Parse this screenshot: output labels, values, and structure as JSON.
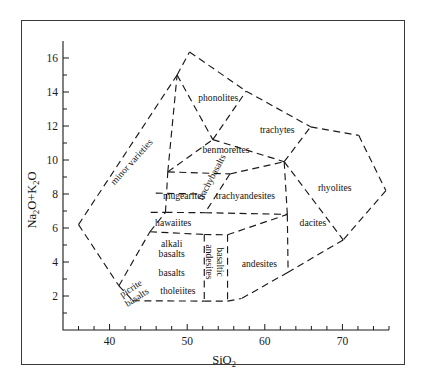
{
  "figure": {
    "kind": "tas-diagram",
    "title": "",
    "background_color": "#ffffff",
    "frame_color": "#3a3a3a",
    "line_color": "#1a1a1a"
  },
  "axes": {
    "x": {
      "label_main": "SiO",
      "label_sub": "2",
      "label_full": "SiO2",
      "min": 34,
      "max": 76,
      "tick_labels": [
        "40",
        "50",
        "60",
        "70"
      ],
      "tick_values": [
        40,
        50,
        60,
        70
      ],
      "minor_step": 2
    },
    "y": {
      "label_parts": [
        "Na",
        "2",
        "O+K",
        "2",
        "O"
      ],
      "label_full": "Na2O+K2O",
      "min": 0,
      "max": 17,
      "tick_labels": [
        "2",
        "4",
        "6",
        "8",
        "10",
        "12",
        "14",
        "16"
      ],
      "tick_values": [
        2,
        4,
        6,
        8,
        10,
        12,
        14,
        16
      ],
      "minor_step": 1
    }
  },
  "chart_data": {
    "type": "scatter",
    "title": "",
    "xlabel": "SiO2",
    "ylabel": "Na2O+K2O",
    "xlim": [
      34,
      76
    ],
    "ylim": [
      0,
      17
    ],
    "grid": false,
    "legend_position": "none",
    "x_ticks": [
      40,
      50,
      60,
      70
    ],
    "y_ticks": [
      2,
      4,
      6,
      8,
      10,
      12,
      14,
      16
    ],
    "x_minor_step": 2,
    "y_minor_step": 1,
    "fields": [
      {
        "name": "minor varieties",
        "label_x": 42.8,
        "label_y": 9.9,
        "rotation": -48,
        "polygon": [
          [
            36.0,
            6.2
          ],
          [
            41.2,
            2.6
          ],
          [
            45.2,
            5.8
          ],
          [
            47.5,
            9.3
          ],
          [
            48.7,
            15.0
          ],
          [
            36.0,
            6.2
          ]
        ]
      },
      {
        "name": "phonolites",
        "label_x": 54.0,
        "label_y": 13.7,
        "rotation": 0,
        "polygon": [
          [
            48.7,
            15.0
          ],
          [
            50.2,
            16.3
          ],
          [
            57.5,
            14.0
          ],
          [
            53.3,
            11.2
          ],
          [
            48.7,
            15.0
          ]
        ]
      },
      {
        "name": "trachytes",
        "label_x": 61.6,
        "label_y": 11.8,
        "rotation": 0,
        "polygon": [
          [
            57.5,
            14.0
          ],
          [
            65.8,
            11.9
          ],
          [
            62.5,
            9.9
          ],
          [
            53.3,
            11.2
          ],
          [
            57.5,
            14.0
          ]
        ]
      },
      {
        "name": "benmoreites",
        "label_x": 55.0,
        "label_y": 10.6,
        "rotation": 0,
        "polygon": [
          [
            53.3,
            11.2
          ],
          [
            62.5,
            9.9
          ],
          [
            55.5,
            9.2
          ],
          [
            47.5,
            9.3
          ],
          [
            53.3,
            11.2
          ]
        ]
      },
      {
        "name": "trachybasalts",
        "label_x": 53.1,
        "label_y": 9.0,
        "rotation": -62,
        "polygon": [
          [
            47.5,
            9.3
          ],
          [
            55.5,
            9.2
          ],
          [
            52.3,
            6.9
          ],
          [
            47.2,
            6.9
          ]
        ]
      },
      {
        "name": "mugearites",
        "label_x": 49.6,
        "label_y": 7.9,
        "rotation": 0,
        "polygon": [
          [
            47.2,
            6.9
          ],
          [
            52.3,
            6.9
          ],
          [
            47.0,
            6.9
          ],
          [
            45.8,
            8.1
          ]
        ]
      },
      {
        "name": "trachyandesites",
        "label_x": 57.5,
        "label_y": 7.9,
        "rotation": 0,
        "polygon": [
          [
            55.5,
            9.2
          ],
          [
            62.5,
            9.9
          ],
          [
            62.9,
            6.8
          ],
          [
            52.3,
            6.9
          ],
          [
            55.5,
            9.2
          ]
        ]
      },
      {
        "name": "rhyolites",
        "label_x": 69.0,
        "label_y": 8.4,
        "rotation": 0,
        "polygon": [
          [
            65.8,
            11.9
          ],
          [
            72.0,
            11.5
          ],
          [
            75.5,
            8.2
          ],
          [
            70.0,
            5.3
          ],
          [
            62.5,
            9.9
          ]
        ]
      },
      {
        "name": "dacites",
        "label_x": 66.2,
        "label_y": 6.3,
        "rotation": 0,
        "polygon": [
          [
            62.9,
            6.8
          ],
          [
            70.0,
            5.3
          ],
          [
            63.0,
            3.4
          ],
          [
            62.9,
            6.8
          ]
        ]
      },
      {
        "name": "hawaiites",
        "label_x": 48.2,
        "label_y": 6.3,
        "rotation": 0,
        "polygon": [
          [
            45.2,
            5.8
          ],
          [
            52.3,
            6.9
          ],
          [
            52.2,
            5.6
          ],
          [
            45.2,
            5.8
          ]
        ]
      },
      {
        "name": "alkali basalts",
        "label_lines": [
          "alkali",
          "basalts"
        ],
        "label_x": 48.0,
        "label_y": 4.8,
        "rotation": 0,
        "polygon": [
          [
            45.2,
            5.8
          ],
          [
            52.2,
            5.6
          ],
          [
            52.2,
            1.7
          ],
          [
            43.0,
            1.7
          ]
        ]
      },
      {
        "name": "basalts",
        "label_x": 48.0,
        "label_y": 3.4,
        "rotation": 0,
        "polygon": []
      },
      {
        "name": "tholeiites",
        "label_x": 48.8,
        "label_y": 2.3,
        "rotation": 0,
        "polygon": []
      },
      {
        "name": "picrite basalts",
        "label_lines": [
          "picrite",
          "basalts"
        ],
        "label_x": 43.1,
        "label_y": 2.2,
        "rotation": -33,
        "polygon": [
          [
            41.2,
            2.6
          ],
          [
            45.2,
            5.8
          ],
          [
            43.0,
            1.7
          ],
          [
            41.2,
            2.6
          ]
        ]
      },
      {
        "name": "basaltic andesites",
        "label_lines": [
          "basaltic",
          "andesites"
        ],
        "label_x": 53.6,
        "label_y": 4.0,
        "rotation": 90,
        "polygon": [
          [
            52.2,
            5.6
          ],
          [
            55.2,
            5.6
          ],
          [
            55.2,
            1.7
          ],
          [
            52.2,
            1.7
          ]
        ]
      },
      {
        "name": "andesites",
        "label_x": 59.3,
        "label_y": 3.9,
        "rotation": 0,
        "polygon": [
          [
            55.2,
            5.6
          ],
          [
            62.9,
            6.8
          ],
          [
            63.0,
            3.4
          ],
          [
            57.0,
            1.8
          ],
          [
            55.2,
            1.7
          ]
        ]
      }
    ]
  },
  "field_labels": [
    "minor varieties",
    "phonolites",
    "trachytes",
    "benmoreites",
    "trachybasalts",
    "mugearites",
    "trachyandesites",
    "rhyolites",
    "dacites",
    "hawaiites",
    "alkali",
    "basalts",
    "basalts",
    "tholeiites",
    "picrite",
    "basalts",
    "basaltic",
    "andesites",
    "andesites"
  ]
}
